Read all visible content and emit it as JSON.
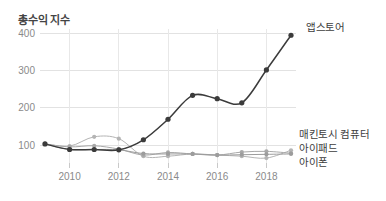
{
  "chart_data": {
    "type": "line",
    "title": "총수익 지수",
    "xlabel": "",
    "ylabel": "",
    "x": [
      2009,
      2010,
      2011,
      2012,
      2013,
      2014,
      2015,
      2016,
      2017,
      2018,
      2019
    ],
    "xlim": [
      2009,
      2019
    ],
    "ylim": [
      55,
      410
    ],
    "xticks": [
      "2010",
      "2012",
      "2014",
      "2016",
      "2018"
    ],
    "xtick_values": [
      2010,
      2012,
      2014,
      2016,
      2018
    ],
    "yticks": [
      "100",
      "200",
      "300",
      "400"
    ],
    "ytick_values": [
      100,
      200,
      300,
      400
    ],
    "grid": true,
    "legend_position": "right-inline",
    "series": [
      {
        "name": "앱스토어",
        "color": "#3b3b3b",
        "emphasis": "primary",
        "values": [
          103,
          88,
          88,
          87,
          114,
          169,
          233,
          224,
          213,
          301,
          394
        ]
      },
      {
        "name": "매킨토시 컴퓨터",
        "color": "#b4b4b4",
        "emphasis": "secondary",
        "values": [
          103,
          97,
          122,
          117,
          70,
          70,
          76,
          73,
          70,
          65,
          86
        ]
      },
      {
        "name": "아이패드",
        "color": "#a8a8a8",
        "emphasis": "secondary",
        "values": [
          103,
          95,
          98,
          89,
          73,
          80,
          76,
          73,
          81,
          83,
          78
        ]
      },
      {
        "name": "아이폰",
        "color": "#9c9c9c",
        "emphasis": "secondary",
        "values": [
          103,
          88,
          88,
          87,
          77,
          76,
          76,
          73,
          74,
          75,
          76
        ]
      }
    ]
  },
  "labels": {
    "title": "총수익 지수",
    "appstore": "앱스토어",
    "mac": "매킨토시 컴퓨터",
    "ipad": "아이패드",
    "iphone": "아이폰"
  },
  "colors": {
    "primary_line": "#3b3b3b",
    "secondary_line": "#b0b0b0",
    "grid": "#e2e2e2",
    "axis_text": "#8a8a8a",
    "title_text": "#444444",
    "background": "#ffffff"
  }
}
